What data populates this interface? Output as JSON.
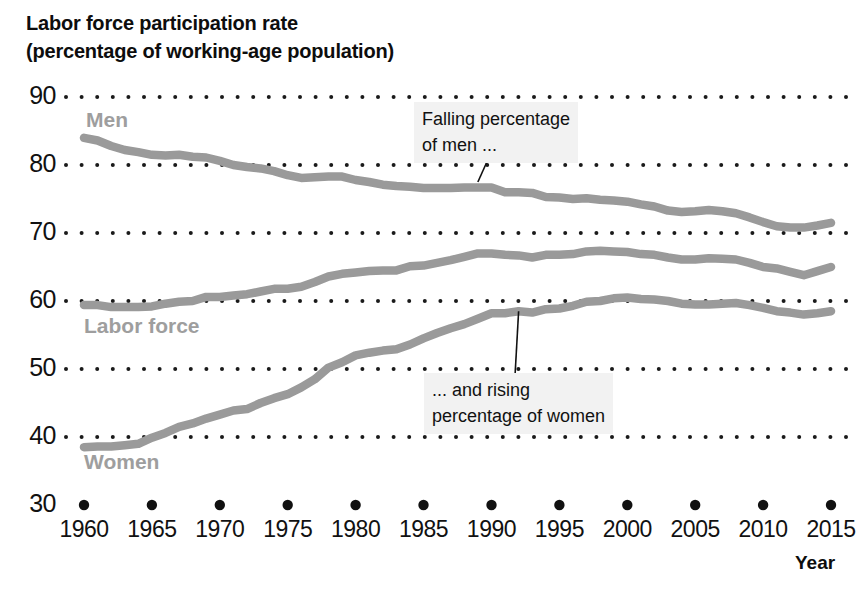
{
  "chart_data": {
    "type": "line",
    "title_line1": "Labor force participation rate",
    "title_line2": "(percentage of working-age population)",
    "xlabel": "Year",
    "ylabel": "",
    "xlim": [
      1959,
      2016
    ],
    "ylim": [
      30,
      90
    ],
    "grid": "dotted-horizontal",
    "legend_position": "inline-labels",
    "y_ticks": [
      30,
      40,
      50,
      60,
      70,
      80,
      90
    ],
    "x_ticks": [
      1960,
      1965,
      1970,
      1975,
      1980,
      1985,
      1990,
      1995,
      2000,
      2005,
      2010,
      2015
    ],
    "line_color": "#9a9a9a",
    "label_color": "#9e9e9e",
    "x": [
      1960,
      1961,
      1962,
      1963,
      1964,
      1965,
      1966,
      1967,
      1968,
      1969,
      1970,
      1971,
      1972,
      1973,
      1974,
      1975,
      1976,
      1977,
      1978,
      1979,
      1980,
      1981,
      1982,
      1983,
      1984,
      1985,
      1986,
      1987,
      1988,
      1989,
      1990,
      1991,
      1992,
      1993,
      1994,
      1995,
      1996,
      1997,
      1998,
      1999,
      2000,
      2001,
      2002,
      2003,
      2004,
      2005,
      2006,
      2007,
      2008,
      2009,
      2010,
      2011,
      2012,
      2013,
      2014,
      2015
    ],
    "series": [
      {
        "name": "Men",
        "values": [
          84.0,
          83.6,
          82.8,
          82.2,
          81.9,
          81.5,
          81.4,
          81.5,
          81.2,
          81.1,
          80.6,
          80.0,
          79.7,
          79.5,
          79.1,
          78.5,
          78.1,
          78.2,
          78.3,
          78.3,
          77.8,
          77.5,
          77.1,
          76.9,
          76.8,
          76.6,
          76.6,
          76.6,
          76.7,
          76.7,
          76.7,
          76.0,
          76.0,
          75.9,
          75.3,
          75.2,
          75.0,
          75.1,
          74.9,
          74.8,
          74.6,
          74.2,
          73.9,
          73.3,
          73.1,
          73.2,
          73.4,
          73.2,
          72.9,
          72.3,
          71.6,
          71.0,
          70.8,
          70.8,
          71.1,
          71.5
        ]
      },
      {
        "name": "Labor force",
        "values": [
          59.4,
          59.4,
          59.1,
          59.1,
          59.1,
          59.2,
          59.6,
          59.9,
          60.0,
          60.6,
          60.6,
          60.8,
          61.0,
          61.4,
          61.8,
          61.8,
          62.1,
          62.8,
          63.6,
          64.0,
          64.2,
          64.4,
          64.5,
          64.5,
          65.1,
          65.2,
          65.6,
          66.0,
          66.5,
          67.0,
          67.0,
          66.8,
          66.7,
          66.4,
          66.8,
          66.8,
          66.9,
          67.3,
          67.4,
          67.3,
          67.2,
          66.9,
          66.8,
          66.4,
          66.1,
          66.1,
          66.3,
          66.2,
          66.1,
          65.6,
          65.0,
          64.8,
          64.3,
          63.8,
          64.4,
          65.0
        ]
      },
      {
        "name": "Women",
        "values": [
          38.5,
          38.6,
          38.6,
          38.8,
          39.0,
          39.9,
          40.6,
          41.5,
          42.0,
          42.7,
          43.3,
          43.9,
          44.1,
          45.0,
          45.7,
          46.3,
          47.3,
          48.5,
          50.2,
          51.0,
          52.0,
          52.4,
          52.7,
          52.9,
          53.6,
          54.5,
          55.3,
          56.0,
          56.6,
          57.4,
          58.2,
          58.2,
          58.5,
          58.3,
          58.8,
          58.9,
          59.3,
          59.9,
          60.0,
          60.4,
          60.5,
          60.3,
          60.2,
          60.0,
          59.6,
          59.5,
          59.5,
          59.6,
          59.7,
          59.4,
          59.0,
          58.5,
          58.3,
          58.0,
          58.2,
          58.5
        ]
      }
    ],
    "annotations": [
      {
        "id": "men-annotation",
        "text_line1": "Falling percentage",
        "text_line2": "of men ...",
        "target_year": 1989,
        "target_value": 77.5
      },
      {
        "id": "women-annotation",
        "text_line1": "... and rising",
        "text_line2": "percentage of women",
        "target_year": 1992,
        "target_value": 58.5
      }
    ]
  }
}
